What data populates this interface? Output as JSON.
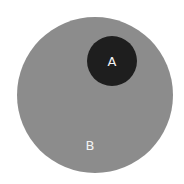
{
  "diagram": {
    "type": "euler",
    "sets": [
      {
        "id": "B",
        "label": "B",
        "color": "#8c8c8c",
        "cx": 95,
        "cy": 95,
        "r": 78
      },
      {
        "id": "A",
        "label": "A",
        "color": "#1e1e1e",
        "cx": 112,
        "cy": 61,
        "r": 25
      }
    ],
    "relationship": "A is a subset of B"
  }
}
